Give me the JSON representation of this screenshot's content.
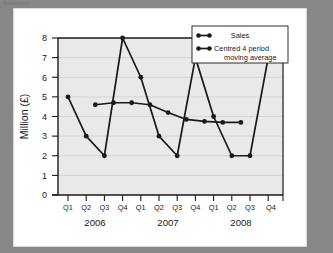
{
  "page": {
    "top_caption": "Solution",
    "background_color": "#878787",
    "card_color": "#ffffff"
  },
  "chart_data": {
    "type": "line",
    "title": "",
    "xlabel": "",
    "ylabel": "Million (£)",
    "ylim": [
      0,
      8
    ],
    "yticks": [
      "0",
      "1",
      "2",
      "3",
      "4",
      "5",
      "6",
      "7",
      "8"
    ],
    "grid": true,
    "plot_background": "#e9e9e9",
    "series_color": "#1a1a1a",
    "legend_position": "top-right",
    "quarter_labels": [
      "Q1",
      "Q2",
      "Q3",
      "Q4",
      "Q1",
      "Q2",
      "Q3",
      "Q4",
      "Q1",
      "Q2",
      "Q3",
      "Q4"
    ],
    "year_labels": [
      "2006",
      "2007",
      "2008"
    ],
    "series": [
      {
        "name": "Sales",
        "x": [
          "2006 Q1",
          "2006 Q2",
          "2006 Q3",
          "2006 Q4",
          "2007 Q1",
          "2007 Q2",
          "2007 Q3",
          "2007 Q4",
          "2008 Q1",
          "2008 Q2",
          "2008 Q3",
          "2008 Q4"
        ],
        "values": [
          5,
          3,
          2,
          8,
          6,
          3,
          2,
          7,
          4,
          2,
          2,
          7
        ]
      },
      {
        "name": "Centred 4 period moving average",
        "x": [
          "2006 Q2.5",
          "2006 Q3.5",
          "2006 Q4.5",
          "2007 Q1.5",
          "2007 Q2.5",
          "2007 Q3.5",
          "2007 Q4.5",
          "2008 Q1.5",
          "2008 Q2.5"
        ],
        "values": [
          4.6,
          4.7,
          4.7,
          4.6,
          4.2,
          3.85,
          3.75,
          3.7,
          3.7
        ]
      }
    ]
  },
  "legend": {
    "entries": [
      {
        "label": "Sales"
      },
      {
        "label": "Centred 4 period",
        "label2": "moving average"
      }
    ]
  }
}
